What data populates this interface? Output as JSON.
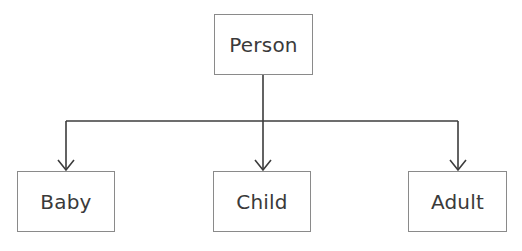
{
  "diagram": {
    "type": "tree",
    "root": {
      "id": "person",
      "label": "Person"
    },
    "children": [
      {
        "id": "baby",
        "label": "Baby"
      },
      {
        "id": "child",
        "label": "Child"
      },
      {
        "id": "adult",
        "label": "Adult"
      }
    ],
    "edges": [
      {
        "from": "person",
        "to": "baby",
        "style": "arrow"
      },
      {
        "from": "person",
        "to": "child",
        "style": "arrow"
      },
      {
        "from": "person",
        "to": "adult",
        "style": "arrow"
      }
    ],
    "colors": {
      "line": "#3c3c3c",
      "box_border": "#8a8a8a",
      "text": "#3a3a3a",
      "background": "#ffffff"
    }
  }
}
